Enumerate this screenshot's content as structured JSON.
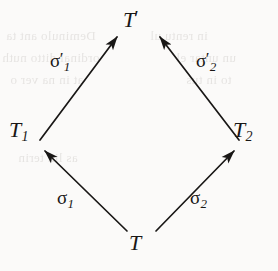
{
  "figure": {
    "name": "commutative-diagram",
    "shape": "diamond",
    "background_color": "#fbfaf9",
    "ink_color": "#191716",
    "ghost_color": "#d2cfcc",
    "width": 278,
    "height": 271
  },
  "nodes": {
    "top": {
      "id": "T-prime",
      "base": "T",
      "prime": "′",
      "sub": ""
    },
    "left": {
      "id": "T-1",
      "base": "T",
      "prime": "",
      "sub": "1"
    },
    "right": {
      "id": "T-2",
      "base": "T",
      "prime": "",
      "sub": "2"
    },
    "bottom": {
      "id": "T",
      "base": "T",
      "prime": "",
      "sub": ""
    }
  },
  "arrows": [
    {
      "id": "sigma-1-prime",
      "symbol": "σ",
      "prime": "′",
      "sub": "1",
      "from": "T-1",
      "to": "T-prime",
      "x1": 40,
      "y1": 140,
      "x2": 117,
      "y2": 37
    },
    {
      "id": "sigma-2-prime",
      "symbol": "σ",
      "prime": "′",
      "sub": "2",
      "from": "T-2",
      "to": "T-prime",
      "x1": 239,
      "y1": 140,
      "x2": 160,
      "y2": 37
    },
    {
      "id": "sigma-1",
      "symbol": "σ",
      "prime": "",
      "sub": "1",
      "from": "T",
      "to": "T-1",
      "x1": 127,
      "y1": 231,
      "x2": 45,
      "y2": 151
    },
    {
      "id": "sigma-2",
      "symbol": "σ",
      "prime": "",
      "sub": "2",
      "from": "T",
      "to": "T-2",
      "x1": 156,
      "y1": 231,
      "x2": 234,
      "y2": 151
    }
  ],
  "ghost_text": {
    "note": "faint mirrored bleed-through from reverse side of scanned page",
    "lines": [
      {
        "text": "Deminulo ant ta",
        "x": 6,
        "y": 28,
        "size": 13
      },
      {
        "text": "ordinal ditto nuth",
        "x": 2,
        "y": 50,
        "size": 13
      },
      {
        "text": "at in na ver o",
        "x": 10,
        "y": 72,
        "size": 13
      },
      {
        "text": "as lin terin",
        "x": 18,
        "y": 150,
        "size": 12
      },
      {
        "text": "in rentu ul",
        "x": 150,
        "y": 28,
        "size": 13
      },
      {
        "text": "un untar el",
        "x": 176,
        "y": 50,
        "size": 13
      },
      {
        "text": "to in tus",
        "x": 186,
        "y": 72,
        "size": 13
      }
    ]
  }
}
